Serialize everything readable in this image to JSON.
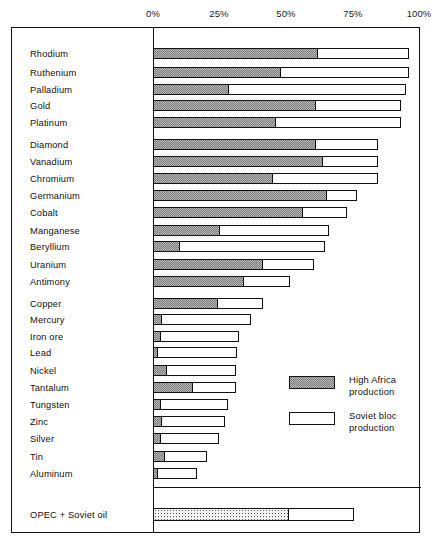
{
  "chart_data": {
    "type": "bar",
    "orientation": "horizontal",
    "title": "",
    "subtitle": "",
    "xlabel": "",
    "ylabel": "",
    "xlim": [
      0,
      100
    ],
    "xunit": "%",
    "grid": false,
    "stacked": true,
    "legend_position": "inside-right",
    "axis_ticks": [
      {
        "label": "0%",
        "value": 0
      },
      {
        "label": "25%",
        "value": 25
      },
      {
        "label": "50%",
        "value": 50
      },
      {
        "label": "75%",
        "value": 75
      },
      {
        "label": "100%",
        "value": 100
      }
    ],
    "series": [
      {
        "name": "High Africa production",
        "key": "africa",
        "fill": "checker-grey"
      },
      {
        "name": "Soviet bloc production",
        "key": "soviet",
        "fill": "white-outline"
      }
    ],
    "categories": [
      "Rhodium",
      "Ruthenium",
      "Palladium",
      "Gold",
      "Platinum",
      "Diamond",
      "Vanadium",
      "Chromium",
      "Germanium",
      "Cobalt",
      "Manganese",
      "Beryllium",
      "Uranium",
      "Antimony",
      "Copper",
      "Mercury",
      "Iron ore",
      "Lead",
      "Nickel",
      "Tantalum",
      "Tungsten",
      "Zinc",
      "Silver",
      "Tin",
      "Aluminum"
    ],
    "rows": [
      {
        "label": "Rhodium",
        "africa": 61.5,
        "total": 95.5
      },
      {
        "label": "Ruthenium",
        "africa": 48.0,
        "total": 95.5
      },
      {
        "label": "Palladium",
        "africa": 28.5,
        "total": 94.5
      },
      {
        "label": "Gold",
        "africa": 61.0,
        "total": 92.5
      },
      {
        "label": "Platinum",
        "africa": 46.0,
        "total": 92.5
      },
      {
        "label": "Diamond",
        "africa": 61.0,
        "total": 84.0
      },
      {
        "label": "Vanadium",
        "africa": 63.5,
        "total": 84.0
      },
      {
        "label": "Chromium",
        "africa": 45.0,
        "total": 84.0
      },
      {
        "label": "Germanium",
        "africa": 65.0,
        "total": 76.0
      },
      {
        "label": "Cobalt",
        "africa": 56.0,
        "total": 72.5
      },
      {
        "label": "Manganese",
        "africa": 25.0,
        "total": 65.5
      },
      {
        "label": "Beryllium",
        "africa": 10.0,
        "total": 64.0
      },
      {
        "label": "Uranium",
        "africa": 41.0,
        "total": 60.0
      },
      {
        "label": "Antimony",
        "africa": 34.0,
        "total": 51.0
      },
      {
        "label": "Copper",
        "africa": 24.5,
        "total": 41.0
      },
      {
        "label": "Mercury",
        "africa": 3.5,
        "total": 36.5
      },
      {
        "label": "Iron ore",
        "africa": 3.0,
        "total": 32.0
      },
      {
        "label": "Lead",
        "africa": 2.0,
        "total": 31.5
      },
      {
        "label": "Nickel",
        "africa": 5.5,
        "total": 31.0
      },
      {
        "label": "Tantalum",
        "africa": 15.0,
        "total": 31.0
      },
      {
        "label": "Tungsten",
        "africa": 3.0,
        "total": 28.0
      },
      {
        "label": "Zinc",
        "africa": 3.5,
        "total": 27.0
      },
      {
        "label": "Silver",
        "africa": 3.0,
        "total": 24.5
      },
      {
        "label": "Tin",
        "africa": 4.5,
        "total": 20.0
      },
      {
        "label": "Aluminum",
        "africa": 2.0,
        "total": 16.5
      }
    ],
    "special_rows": [
      {
        "label": "OPEC + Soviet oil",
        "africa": 51.0,
        "total": 75.0,
        "fill": "dotted"
      }
    ],
    "annotations": []
  },
  "legend": {
    "entries": [
      {
        "swatch": "checker-grey",
        "line1": "High  Africa",
        "line2": "production"
      },
      {
        "swatch": "white-outline",
        "line1": "Soviet  bloc",
        "line2": "production"
      }
    ]
  },
  "colors": {
    "ink": "#111111",
    "paper": "#ffffff",
    "hatch_light": "#b6b6b6",
    "hatch_dark": "#7d7d7d"
  }
}
